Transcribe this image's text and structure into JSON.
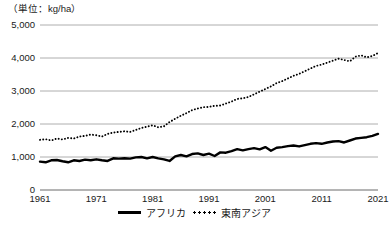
{
  "unit_label": "（単位：kg/ha）",
  "legend": {
    "position": "bottom-center",
    "entries": [
      {
        "label": "アフリカ",
        "style": "solid",
        "swatch": "solid-line-swatch"
      },
      {
        "label": "東南アジア",
        "style": "dotted",
        "swatch": "dotted-line-swatch"
      }
    ]
  },
  "axes": {
    "y_ticks": [
      "0",
      "1,000",
      "2,000",
      "3,000",
      "4,000",
      "5,000"
    ],
    "x_ticks": [
      "1961",
      "1971",
      "1981",
      "1991",
      "2001",
      "2011",
      "2021"
    ]
  },
  "chart_data": {
    "type": "line",
    "title": "",
    "subtitle": "",
    "xlabel": "",
    "ylabel": "（単位：kg/ha）",
    "xlim": [
      1961,
      2021
    ],
    "ylim": [
      0,
      5000
    ],
    "grid": true,
    "legend_position": "bottom-center",
    "x": [
      1961,
      1962,
      1963,
      1964,
      1965,
      1966,
      1967,
      1968,
      1969,
      1970,
      1971,
      1972,
      1973,
      1974,
      1975,
      1976,
      1977,
      1978,
      1979,
      1980,
      1981,
      1982,
      1983,
      1984,
      1985,
      1986,
      1987,
      1988,
      1989,
      1990,
      1991,
      1992,
      1993,
      1994,
      1995,
      1996,
      1997,
      1998,
      1999,
      2000,
      2001,
      2002,
      2003,
      2004,
      2005,
      2006,
      2007,
      2008,
      2009,
      2010,
      2011,
      2012,
      2013,
      2014,
      2015,
      2016,
      2017,
      2018,
      2019,
      2020,
      2021
    ],
    "series": [
      {
        "name": "アフリカ",
        "style": "solid",
        "values": [
          860,
          840,
          900,
          910,
          870,
          840,
          900,
          880,
          920,
          900,
          930,
          900,
          880,
          960,
          950,
          960,
          950,
          990,
          1000,
          960,
          1000,
          960,
          930,
          880,
          1020,
          1060,
          1020,
          1090,
          1110,
          1060,
          1100,
          1030,
          1140,
          1130,
          1180,
          1240,
          1200,
          1240,
          1270,
          1230,
          1300,
          1190,
          1280,
          1300,
          1330,
          1350,
          1320,
          1360,
          1400,
          1420,
          1400,
          1440,
          1470,
          1480,
          1440,
          1500,
          1560,
          1580,
          1600,
          1640,
          1700
        ]
      },
      {
        "name": "東南アジア",
        "style": "dotted",
        "values": [
          1520,
          1540,
          1500,
          1560,
          1530,
          1580,
          1560,
          1620,
          1640,
          1680,
          1660,
          1620,
          1700,
          1740,
          1760,
          1780,
          1760,
          1820,
          1880,
          1920,
          1960,
          1900,
          1930,
          2060,
          2160,
          2250,
          2330,
          2420,
          2470,
          2510,
          2520,
          2550,
          2560,
          2620,
          2680,
          2760,
          2780,
          2820,
          2900,
          2980,
          3060,
          3140,
          3240,
          3300,
          3380,
          3460,
          3520,
          3600,
          3680,
          3760,
          3800,
          3860,
          3920,
          3980,
          3940,
          3900,
          4040,
          4080,
          4020,
          4060,
          4150
        ]
      }
    ]
  }
}
